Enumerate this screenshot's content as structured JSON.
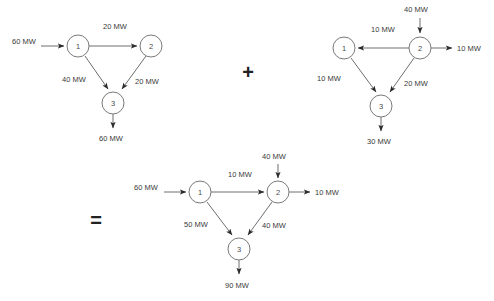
{
  "figure": {
    "operators": {
      "plus": "+",
      "equals": "="
    },
    "node_labels": {
      "n1": "1",
      "n2": "2",
      "n3": "3"
    }
  },
  "diagram_a": {
    "name": "first-network",
    "inject_1": "60 MW",
    "edge_1_2": "20 MW",
    "edge_1_3": "40 MW",
    "edge_2_3": "20 MW",
    "out_3": "60 MW",
    "nodes": [
      "1",
      "2",
      "3"
    ]
  },
  "diagram_b": {
    "name": "second-network",
    "inject_2": "40 MW",
    "edge_2_1": "10 MW",
    "out_2": "10 MW",
    "edge_1_3": "10 MW",
    "edge_2_3": "20 MW",
    "out_3": "30 MW",
    "nodes": [
      "1",
      "2",
      "3"
    ]
  },
  "diagram_c": {
    "name": "result-network",
    "inject_1": "60 MW",
    "inject_2": "40 MW",
    "edge_1_2": "10 MW",
    "out_2": "10 MW",
    "edge_1_3": "50 MW",
    "edge_2_3": "40 MW",
    "out_3": "90 MW",
    "nodes": [
      "1",
      "2",
      "3"
    ]
  },
  "colors": {
    "stroke": "#6e6e6e",
    "text": "#3a3a3a",
    "background": "#ffffff"
  }
}
